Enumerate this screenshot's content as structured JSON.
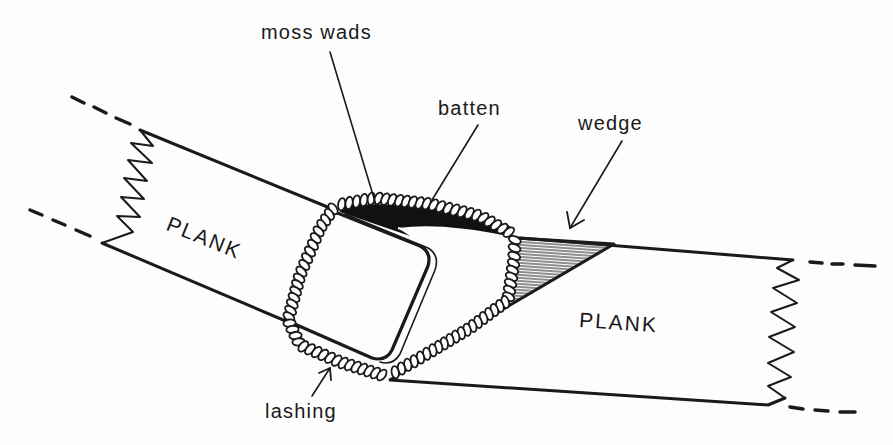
{
  "diagram": {
    "type": "technical-illustration",
    "labels": {
      "moss_wads": "moss wads",
      "batten": "batten",
      "wedge": "wedge",
      "lashing": "lashing",
      "plank_left": "PLANK",
      "plank_right": "PLANK"
    },
    "colors": {
      "ink": "#1a1a1a",
      "paper": "#fdfdfd",
      "hatch": "#333333"
    }
  }
}
